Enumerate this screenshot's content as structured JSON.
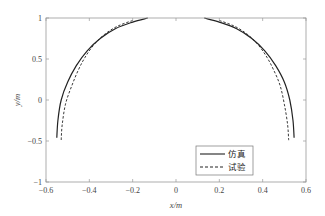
{
  "chart_data": {
    "type": "line",
    "title": "",
    "xlabel": "x/m",
    "ylabel": "y/m",
    "xlim": [
      -0.6,
      0.6
    ],
    "ylim": [
      -1,
      1
    ],
    "xticks": [
      -0.6,
      -0.4,
      -0.2,
      0,
      0.2,
      0.4,
      0.6
    ],
    "xtick_labels": [
      "−0.6",
      "−0.4",
      "−0.2",
      "0",
      "0.2",
      "0.4",
      "0.6"
    ],
    "yticks": [
      -1,
      -0.5,
      0,
      0.5,
      1
    ],
    "ytick_labels": [
      "−1",
      "−0.5",
      "0",
      "0.5",
      "1"
    ],
    "grid": false,
    "legend_position": "lower right",
    "series": [
      {
        "name": "仿真",
        "style": "solid",
        "color": "#222222",
        "segments": [
          {
            "x": [
              -0.13,
              -0.2,
              -0.28,
              -0.35,
              -0.41,
              -0.46,
              -0.5,
              -0.53,
              -0.545,
              -0.55
            ],
            "y": [
              1.0,
              0.95,
              0.87,
              0.75,
              0.6,
              0.42,
              0.22,
              0.0,
              -0.25,
              -0.46
            ]
          },
          {
            "x": [
              0.13,
              0.2,
              0.28,
              0.35,
              0.41,
              0.46,
              0.5,
              0.525,
              0.54,
              0.545
            ],
            "y": [
              1.0,
              0.95,
              0.87,
              0.75,
              0.6,
              0.42,
              0.22,
              0.0,
              -0.25,
              -0.46
            ]
          }
        ]
      },
      {
        "name": "试验",
        "style": "dashed",
        "color": "#222222",
        "segments": [
          {
            "x": [
              -0.2,
              -0.27,
              -0.33,
              -0.38,
              -0.42,
              -0.45,
              -0.48,
              -0.51,
              -0.525,
              -0.53
            ],
            "y": [
              0.97,
              0.9,
              0.8,
              0.67,
              0.52,
              0.37,
              0.18,
              -0.05,
              -0.3,
              -0.49
            ]
          },
          {
            "x": [
              0.2,
              0.27,
              0.33,
              0.38,
              0.42,
              0.45,
              0.48,
              0.5,
              0.515,
              0.52
            ],
            "y": [
              0.97,
              0.9,
              0.8,
              0.67,
              0.52,
              0.37,
              0.18,
              -0.05,
              -0.3,
              -0.49
            ]
          }
        ]
      }
    ]
  },
  "legend": {
    "items": [
      {
        "label": "仿真",
        "style": "solid"
      },
      {
        "label": "试验",
        "style": "dashed"
      }
    ]
  }
}
